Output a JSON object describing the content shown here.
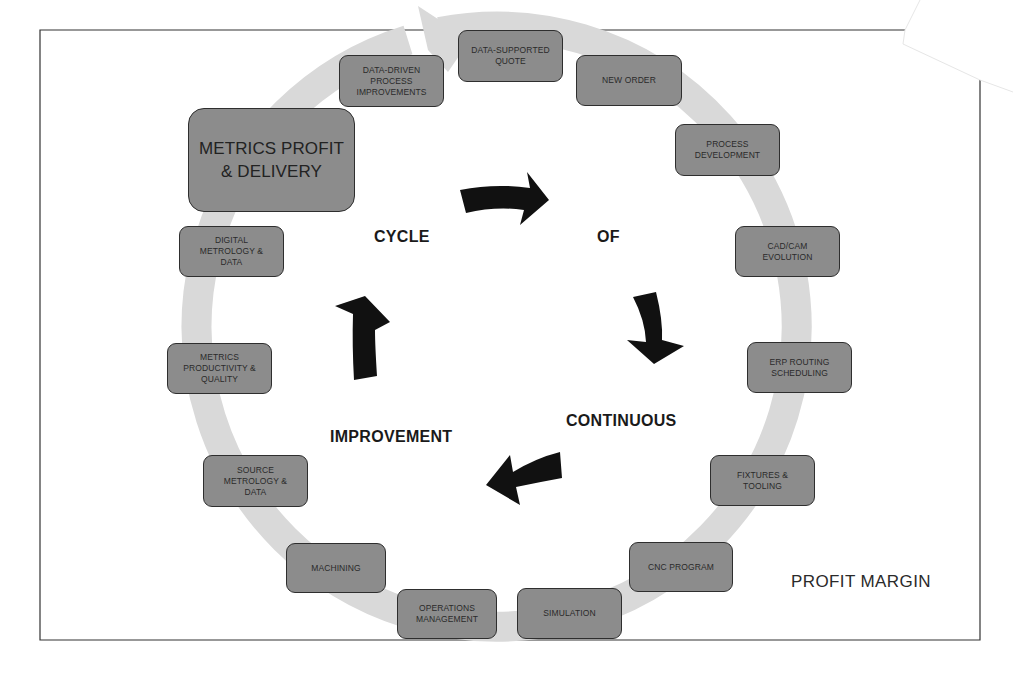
{
  "diagram": {
    "title_words": {
      "cycle": "CYCLE",
      "of": "OF",
      "continuous": "CONTINUOUS",
      "improvement": "IMPROVEMENT"
    },
    "corner_label": "PROFIT MARGIN",
    "steps": [
      {
        "label": "DATA-SUPPORTED\nQUOTE"
      },
      {
        "label": "NEW ORDER"
      },
      {
        "label": "PROCESS\nDEVELOPMENT"
      },
      {
        "label": "CAD/CAM\nEVOLUTION"
      },
      {
        "label": "ERP ROUTING\nSCHEDULING"
      },
      {
        "label": "FIXTURES &\nTOOLING"
      },
      {
        "label": "CNC PROGRAM"
      },
      {
        "label": "SIMULATION"
      },
      {
        "label": "OPERATIONS\nMANAGEMENT"
      },
      {
        "label": "MACHINING"
      },
      {
        "label": "SOURCE\nMETROLOGY &\nDATA"
      },
      {
        "label": "METRICS\nPRODUCTIVITY &\nQUALITY"
      },
      {
        "label": "DIGITAL\nMETROLOGY &\nDATA"
      },
      {
        "label": "METRICS PROFIT\n& DELIVERY"
      },
      {
        "label": "DATA-DRIVEN\nPROCESS\nIMPROVEMENTS"
      }
    ],
    "colors": {
      "box_fill": "#8c8c8c",
      "box_border": "#2e2e2e",
      "ring": "#d9d9d9",
      "arrows": "#111111",
      "frame": "#333333"
    }
  }
}
